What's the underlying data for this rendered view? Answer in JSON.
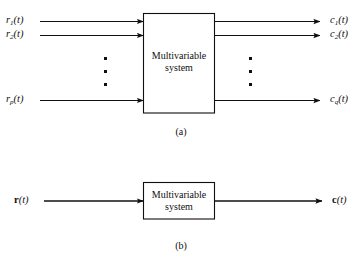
{
  "figure": {
    "title_text": "Multivariable system block diagrams",
    "panels": [
      {
        "id": "panel-a",
        "caption": "(a)",
        "block_label_line1": "Multivariable",
        "block_label_line2": "system",
        "inputs": [
          {
            "base": "r",
            "sub": "1",
            "arg": "(t)"
          },
          {
            "base": "r",
            "sub": "2",
            "arg": "(t)"
          },
          {
            "base": "r",
            "sub": "p",
            "arg": "(t)"
          }
        ],
        "outputs": [
          {
            "base": "c",
            "sub": "1",
            "arg": "(t)"
          },
          {
            "base": "c",
            "sub": "2",
            "arg": "(t)"
          },
          {
            "base": "c",
            "sub": "q",
            "arg": "(t)"
          }
        ],
        "input_ellipsis_dots": 3,
        "output_ellipsis_dots": 3
      },
      {
        "id": "panel-b",
        "caption": "(b)",
        "block_label_line1": "Multivariable",
        "block_label_line2": "system",
        "inputs": [
          {
            "base": "r",
            "sub": "",
            "arg": "(t)"
          }
        ],
        "outputs": [
          {
            "base": "c",
            "sub": "",
            "arg": "(t)"
          }
        ]
      }
    ],
    "colors": {
      "line": "#101010",
      "text": "#101010",
      "background": "#ffffff"
    }
  }
}
